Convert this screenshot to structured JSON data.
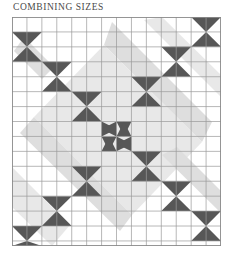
{
  "page": {
    "title": "COMBINING SIZES",
    "background_color": "#ffffff"
  },
  "quilt": {
    "name": "combining-sizes-quilt-diagram",
    "grid": {
      "columns": 14,
      "rows": 15,
      "cell_size": 14.93,
      "line_color": "#9a9a9a",
      "border_color": "#8a8a8a"
    },
    "colors": {
      "dark": "#575757",
      "light": "#ffffff",
      "watermark": "#dedede",
      "watermark_soft": "#e8e8e8"
    },
    "watermark": {
      "shape": "diamond-band",
      "description": "faint grey diagonal diamond band behind the pieced blocks"
    },
    "units": [
      {
        "kind": "bowtie-horizontal",
        "size": 2,
        "col": 0,
        "row": 1
      },
      {
        "kind": "bowtie-horizontal",
        "size": 2,
        "col": 2,
        "row": 3
      },
      {
        "kind": "bowtie-horizontal",
        "size": 2,
        "col": 4,
        "row": 5
      },
      {
        "kind": "bowtie-small",
        "size": 1,
        "col": 6,
        "row": 7
      },
      {
        "kind": "bowtie-small",
        "size": 1,
        "col": 7,
        "row": 7
      },
      {
        "kind": "bowtie-small",
        "size": 1,
        "col": 6,
        "row": 8
      },
      {
        "kind": "bowtie-small",
        "size": 1,
        "col": 7,
        "row": 8
      },
      {
        "kind": "bowtie-horizontal",
        "size": 2,
        "col": 8,
        "row": 9
      },
      {
        "kind": "bowtie-horizontal",
        "size": 2,
        "col": 10,
        "row": 11
      },
      {
        "kind": "bowtie-horizontal",
        "size": 2,
        "col": 12,
        "row": 13
      },
      {
        "kind": "bowtie-vertical",
        "size": 2,
        "col": 12,
        "row": 0
      },
      {
        "kind": "bowtie-vertical",
        "size": 2,
        "col": 10,
        "row": 2
      },
      {
        "kind": "bowtie-vertical",
        "size": 2,
        "col": 8,
        "row": 4
      },
      {
        "kind": "bowtie-vertical",
        "size": 2,
        "col": 4,
        "row": 10
      },
      {
        "kind": "bowtie-vertical",
        "size": 2,
        "col": 2,
        "row": 12
      },
      {
        "kind": "bowtie-vertical",
        "size": 2,
        "col": 0,
        "row": 14
      }
    ]
  }
}
